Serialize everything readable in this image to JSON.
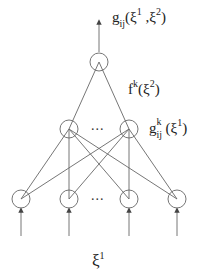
{
  "diagram": {
    "type": "neural-network",
    "labels": {
      "output": {
        "base": "g",
        "sub": "ij",
        "open": "(ξ",
        "sup1": "1",
        "mid": " ,ξ",
        "sup2": "2",
        "close": ")"
      },
      "hidden_top": {
        "base": "f",
        "sup": "k",
        "open": "(ξ",
        "sup2": "2",
        "close": ")"
      },
      "hidden_mid": {
        "base": "g",
        "sup": "k",
        "sub": "ij",
        "open": "(ξ",
        "sup1": "1",
        "close": ")"
      },
      "input": {
        "base": "ξ",
        "sup": "1"
      },
      "ellipsis_mid": "...",
      "ellipsis_bottom": "..."
    },
    "colors": {
      "stroke": "#555555",
      "text": "#222222",
      "background": "#ffffff"
    },
    "layers": [
      {
        "name": "output",
        "nodes": [
          [
            99,
            62
          ]
        ]
      },
      {
        "name": "hidden",
        "nodes": [
          [
            69,
            129
          ],
          [
            129,
            129
          ]
        ]
      },
      {
        "name": "input",
        "nodes": [
          [
            21,
            199
          ],
          [
            69,
            199
          ],
          [
            129,
            199
          ],
          [
            177,
            199
          ]
        ]
      }
    ]
  }
}
